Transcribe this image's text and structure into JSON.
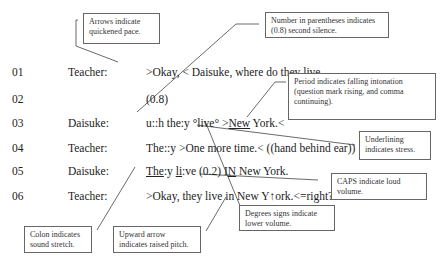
{
  "transcript": [
    {
      "num": "01",
      "speaker": "Teacher:",
      "segments": [
        {
          "t": ">Okay, < Daisuke, where do they live,",
          "u": false
        }
      ]
    },
    {
      "num": "02",
      "speaker": "",
      "segments": [
        {
          "t": "(0.8)",
          "u": false
        }
      ]
    },
    {
      "num": "03",
      "speaker": "Daisuke:",
      "segments": [
        {
          "t": "u::h the:y °live° >",
          "u": false
        },
        {
          "t": "New",
          "u": true
        },
        {
          "t": " York.<",
          "u": false
        }
      ]
    },
    {
      "num": "04",
      "speaker": "Teacher:",
      "segments": [
        {
          "t": "The::y >One more time.< ((hand behind ear))",
          "u": false
        }
      ]
    },
    {
      "num": "05",
      "speaker": "Daisuke:",
      "segments": [
        {
          "t": "The",
          "u": true
        },
        {
          "t": ":y ",
          "u": false
        },
        {
          "t": "li",
          "u": true
        },
        {
          "t": ":ve (0.2) I",
          "u": false
        },
        {
          "t": "N",
          "u": true
        },
        {
          "t": " New York.",
          "u": false
        }
      ]
    },
    {
      "num": "06",
      "speaker": "Teacher:",
      "segments": [
        {
          "t": ">Okay, they live in New Y↑ork.<=right?",
          "u": false
        }
      ]
    }
  ],
  "notes": {
    "arrows": "Arrows indicate quickened pace.",
    "number": "Number in parentheses indicates (0.8) second silence.",
    "period": "Period indicates falling intonation (question mark rising, and comma continuing).",
    "underlining": "Underlining indicates stress.",
    "caps": "CAPS indicate loud volume.",
    "degrees": "Degrees signs indicate lower volume.",
    "colon": "Colon indicates sound stretch.",
    "upward": "Upward arrow indicates raised pitch."
  }
}
